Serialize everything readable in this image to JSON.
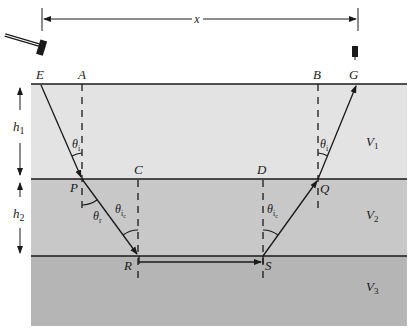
{
  "figure": {
    "colors": {
      "background": "#ffffff",
      "layer1": "#e3e3e3",
      "layer2": "#c8c8c8",
      "layer3": "#b5b5b5",
      "line": "#1a1a1a"
    },
    "distance_label": "x",
    "thickness_labels": {
      "h1": {
        "main": "h",
        "sub": "1"
      },
      "h2": {
        "main": "h",
        "sub": "2"
      }
    },
    "points": {
      "E": "E",
      "A": "A",
      "B": "B",
      "G": "G",
      "C": "C",
      "D": "D",
      "P": "P",
      "Q": "Q",
      "R": "R",
      "S": "S"
    },
    "velocities": {
      "v1": {
        "main": "V",
        "sub": "1"
      },
      "v2": {
        "main": "V",
        "sub": "2"
      },
      "v3": {
        "main": "V",
        "sub": "3"
      }
    },
    "angles": {
      "theta_i": {
        "main": "θ",
        "sub": "i"
      },
      "theta_r": {
        "main": "θ",
        "sub": "r"
      },
      "theta_ic": {
        "main": "θ",
        "sub": "i",
        "subsub": "c"
      }
    },
    "source_icon": "hammer-icon",
    "receiver_icon": "geophone-icon"
  }
}
